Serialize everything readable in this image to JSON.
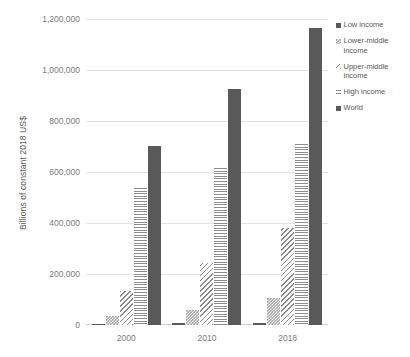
{
  "chart_data": {
    "type": "bar",
    "title": "",
    "xlabel": "",
    "ylabel": "Billions of constant 2018 US$",
    "categories": [
      "2000",
      "2010",
      "2018"
    ],
    "ylim": [
      0,
      1200000
    ],
    "y_ticks": [
      0,
      200000,
      400000,
      600000,
      800000,
      1000000,
      1200000
    ],
    "y_tick_labels": [
      "0",
      "200,000",
      "400,000",
      "600,000",
      "800,000",
      "1,000,000",
      "1,200,000"
    ],
    "grid": true,
    "legend_position": "right",
    "series": [
      {
        "name": "Low income",
        "pattern": "solid",
        "color": "#595959",
        "values": [
          4000,
          6000,
          9000
        ]
      },
      {
        "name": "Lower-middle income",
        "pattern": "checker",
        "color": "#a6a6a6",
        "values": [
          36000,
          58000,
          107000
        ]
      },
      {
        "name": "Upper-middle income",
        "pattern": "diagonal-hatch",
        "color": "#8c8c8c",
        "values": [
          133000,
          243000,
          379000
        ]
      },
      {
        "name": "High income",
        "pattern": "horizontal-lines",
        "color": "#8c8c8c",
        "values": [
          537000,
          614000,
          710000
        ]
      },
      {
        "name": "World",
        "pattern": "solid",
        "color": "#595959",
        "values": [
          701000,
          925000,
          1165000
        ]
      }
    ]
  },
  "legend": {
    "items": [
      {
        "label": "Low income"
      },
      {
        "label": "Lower-middle income"
      },
      {
        "label": "Upper-middle income"
      },
      {
        "label": "High income"
      },
      {
        "label": "World"
      }
    ]
  }
}
